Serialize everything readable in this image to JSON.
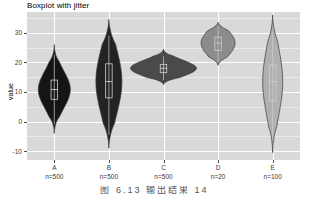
{
  "figure": {
    "title": "Boxplot with jitter",
    "caption": "图 6.13  输出结果 14"
  },
  "chart_data": {
    "type": "boxplot",
    "title": "Boxplot with jitter",
    "xlabel": "",
    "ylabel": "value",
    "ylim": [
      -13,
      37
    ],
    "yticks": [
      -10,
      0,
      10,
      20,
      30
    ],
    "ytick_labels": [
      "-10",
      "0",
      "10",
      "20",
      "30"
    ],
    "grid": true,
    "legend": "none",
    "categories": [
      "A",
      "B",
      "C",
      "D",
      "E"
    ],
    "xtick_labels": [
      "A",
      "B",
      "C",
      "D",
      "E"
    ],
    "counts": [
      500,
      500,
      500,
      20,
      100
    ],
    "count_labels": [
      "n=500",
      "n=500",
      "n=500",
      "n=20",
      "n=100"
    ],
    "fill_colors": [
      "#151515",
      "#232323",
      "#4a4a4a",
      "#8c8c8c",
      "#b0b0b0"
    ],
    "outline_color": "#3a3a3a",
    "box_outline_color": "#cfcfcf",
    "panel_color": "#d9d9d9",
    "grid_color": "#ffffff",
    "series": [
      {
        "name": "A",
        "violin_min": -4.0,
        "violin_max": 26.0,
        "q1": 7.5,
        "median": 10.8,
        "q3": 14.0,
        "whisker_low": -1.0,
        "whisker_high": 22.5,
        "half_width_px": 16
      },
      {
        "name": "B",
        "violin_min": -9.0,
        "violin_max": 34.5,
        "q1": 8.0,
        "median": 13.5,
        "q3": 19.5,
        "whisker_low": -4.5,
        "whisker_high": 29.0,
        "half_width_px": 13
      },
      {
        "name": "C",
        "violin_min": 12.5,
        "violin_max": 24.5,
        "q1": 16.5,
        "median": 18.0,
        "q3": 19.3,
        "whisker_low": 14.0,
        "whisker_high": 22.0,
        "half_width_px": 33
      },
      {
        "name": "D",
        "violin_min": 19.0,
        "violin_max": 33.5,
        "q1": 24.0,
        "median": 26.5,
        "q3": 28.5,
        "whisker_low": 20.0,
        "whisker_high": 32.0,
        "half_width_px": 17
      },
      {
        "name": "E",
        "violin_min": -10.5,
        "violin_max": 36.0,
        "q1": 7.0,
        "median": 13.5,
        "q3": 19.0,
        "whisker_low": -6.0,
        "whisker_high": 30.0,
        "half_width_px": 10
      }
    ]
  }
}
